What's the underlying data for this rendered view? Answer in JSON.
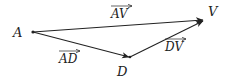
{
  "diagram": {
    "type": "vector-triangle",
    "points": {
      "A": {
        "label": "A",
        "x": 33,
        "y": 32
      },
      "D": {
        "label": "D",
        "x": 130,
        "y": 57
      },
      "V": {
        "label": "V",
        "x": 204,
        "y": 20
      }
    },
    "vectors": [
      {
        "id": "AV",
        "from": "A",
        "to": "V",
        "label": "AV"
      },
      {
        "id": "AD",
        "from": "A",
        "to": "D",
        "label": "AD"
      },
      {
        "id": "DV",
        "from": "D",
        "to": "V",
        "label": "DV"
      }
    ],
    "colors": {
      "stroke": "#222222",
      "background": "#ffffff"
    }
  }
}
